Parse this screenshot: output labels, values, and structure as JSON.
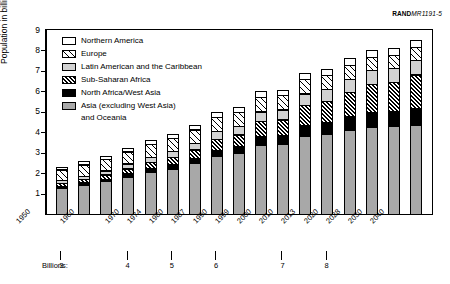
{
  "credit": {
    "brand": "RAND",
    "code": "MR1191-5"
  },
  "chart_data": {
    "type": "bar",
    "stacked": true,
    "title": "",
    "xlabel": "",
    "ylabel": "Population in billions",
    "ylim": [
      0,
      9
    ],
    "yticks": [
      1,
      2,
      3,
      4,
      5,
      6,
      7,
      8,
      9
    ],
    "grid": false,
    "legend_position": "upper-left",
    "categories": [
      "1950",
      "1955",
      "1960",
      "1965",
      "1970",
      "1974",
      "1980",
      "1987",
      "1990",
      "1999",
      "2000",
      "2010",
      "2013",
      "2020",
      "2028",
      "2030",
      "2040"
    ],
    "tick_labels": [
      "1950",
      "1960",
      "1970",
      "1974",
      "1980",
      "1987",
      "1990",
      "1999",
      "2000",
      "2010",
      "2013",
      "2020",
      "2028",
      "2030",
      "2040"
    ],
    "series": [
      {
        "name": "Asia (excluding West Asia) and Oceania",
        "pattern": "solid-gray",
        "color": "#a8a8a8",
        "values": [
          1.3,
          1.45,
          1.62,
          1.85,
          2.07,
          2.25,
          2.5,
          2.85,
          3.0,
          3.4,
          3.45,
          3.85,
          3.95,
          4.15,
          4.3,
          4.33,
          4.4
        ]
      },
      {
        "name": "North Africa/West Asia",
        "pattern": "solid-black",
        "color": "#000000",
        "values": [
          0.11,
          0.13,
          0.15,
          0.18,
          0.21,
          0.24,
          0.28,
          0.34,
          0.37,
          0.45,
          0.46,
          0.56,
          0.59,
          0.66,
          0.72,
          0.74,
          0.8
        ]
      },
      {
        "name": "Sub-Saharan Africa",
        "pattern": "dense-hatch",
        "color": "#000000",
        "values": [
          0.18,
          0.21,
          0.24,
          0.28,
          0.33,
          0.37,
          0.45,
          0.56,
          0.6,
          0.77,
          0.79,
          1.0,
          1.07,
          1.25,
          1.42,
          1.46,
          1.7
        ]
      },
      {
        "name": "Latin American and the Caribbean",
        "pattern": "light-gray",
        "color": "#d2d2d2",
        "values": [
          0.17,
          0.19,
          0.22,
          0.26,
          0.29,
          0.32,
          0.36,
          0.42,
          0.44,
          0.51,
          0.52,
          0.59,
          0.61,
          0.66,
          0.7,
          0.71,
          0.75
        ]
      },
      {
        "name": "Europe",
        "pattern": "sparse-hatch",
        "color": "#000000",
        "values": [
          0.55,
          0.58,
          0.6,
          0.63,
          0.66,
          0.68,
          0.69,
          0.71,
          0.72,
          0.73,
          0.73,
          0.73,
          0.72,
          0.71,
          0.69,
          0.68,
          0.65
        ]
      },
      {
        "name": "Northern America",
        "pattern": "white",
        "color": "#ffffff",
        "values": [
          0.17,
          0.19,
          0.2,
          0.21,
          0.23,
          0.24,
          0.25,
          0.27,
          0.28,
          0.31,
          0.31,
          0.34,
          0.35,
          0.37,
          0.39,
          0.39,
          0.41
        ]
      }
    ],
    "totals": [
      2.48,
      2.75,
      3.03,
      3.41,
      3.79,
      4.1,
      4.53,
      5.15,
      5.41,
      6.17,
      6.26,
      7.07,
      7.29,
      7.8,
      8.22,
      8.31,
      8.71
    ],
    "annotation_row_label": "Billions:",
    "annotation_markers": [
      {
        "value": "3",
        "at_category": "1960"
      },
      {
        "value": "4",
        "at_category": "1974"
      },
      {
        "value": "5",
        "at_category": "1987"
      },
      {
        "value": "6",
        "at_category": "1999"
      },
      {
        "value": "7",
        "at_category": "2013"
      },
      {
        "value": "8",
        "at_category": "2028"
      }
    ]
  },
  "legend": {
    "items": [
      {
        "label": "Northern America",
        "pattern": "white"
      },
      {
        "label": "Europe",
        "pattern": "sparse-hatch"
      },
      {
        "label": "Latin American and the Caribbean",
        "pattern": "light-gray"
      },
      {
        "label": "Sub-Saharan Africa",
        "pattern": "dense-hatch"
      },
      {
        "label": "North Africa/West Asia",
        "pattern": "solid-black"
      },
      {
        "label": "Asia (excluding West Asia)",
        "pattern": "solid-gray"
      }
    ],
    "continuation_line": "and Oceania"
  }
}
